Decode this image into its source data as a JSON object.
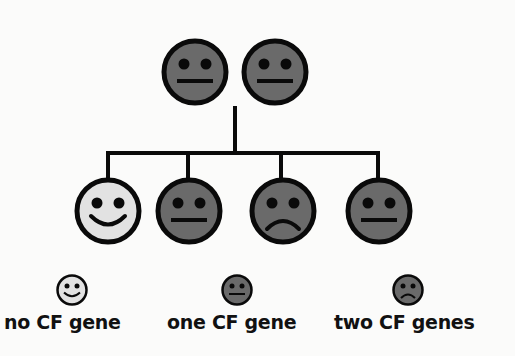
{
  "colors": {
    "background": "#fbfbfa",
    "outline": "#0a0a0a",
    "carrier_fill": "#6a6a6a",
    "affected_fill": "#6a6a6a",
    "unaffected_fill": "#e2e2e2"
  },
  "parents": [
    {
      "label": "parent 1",
      "status": "one CF gene",
      "expression": "neutral"
    },
    {
      "label": "parent 2",
      "status": "one CF gene",
      "expression": "neutral"
    }
  ],
  "children": [
    {
      "label": "child 1",
      "status": "no CF gene",
      "expression": "smile"
    },
    {
      "label": "child 2",
      "status": "one CF gene",
      "expression": "neutral"
    },
    {
      "label": "child 3",
      "status": "two CF genes",
      "expression": "frown"
    },
    {
      "label": "child 4",
      "status": "one CF gene",
      "expression": "neutral"
    }
  ],
  "legend": [
    {
      "icon": "smile-face-icon",
      "label": "no CF gene"
    },
    {
      "icon": "neutral-face-icon",
      "label": "one CF gene"
    },
    {
      "icon": "frown-face-icon",
      "label": "two CF genes"
    }
  ]
}
